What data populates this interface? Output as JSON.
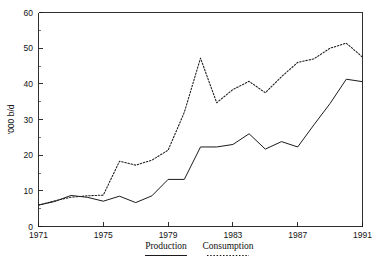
{
  "chart_data": {
    "type": "line",
    "title": "",
    "xlabel": "",
    "ylabel": "'000 b/d",
    "xlim": [
      1971,
      1991
    ],
    "ylim": [
      0,
      60
    ],
    "grid": false,
    "legend_position": "bottom",
    "x": [
      1971,
      1972,
      1973,
      1974,
      1975,
      1976,
      1977,
      1978,
      1979,
      1980,
      1981,
      1982,
      1983,
      1984,
      1985,
      1986,
      1987,
      1988,
      1989,
      1990,
      1991
    ],
    "xticks": [
      1971,
      1975,
      1979,
      1983,
      1987,
      1991
    ],
    "xtick_labels": [
      "1971",
      "1975",
      "1979",
      "1983",
      "1987",
      "1991"
    ],
    "yticks": [
      0,
      10,
      20,
      30,
      40,
      50,
      60
    ],
    "ytick_labels": [
      "0",
      "10",
      "20",
      "30",
      "40",
      "50",
      "60"
    ],
    "yticks_minor": [
      5,
      15,
      25,
      35,
      45,
      55
    ],
    "series": [
      {
        "name": "Production",
        "style": "solid",
        "color": "#1b1b1b",
        "values": [
          6.0,
          7.0,
          8.7,
          8.2,
          7.1,
          8.5,
          6.7,
          8.6,
          13.2,
          13.2,
          22.3,
          22.3,
          23.0,
          26.0,
          21.7,
          23.8,
          22.3,
          28.5,
          34.5,
          41.3,
          40.6
        ]
      },
      {
        "name": "Consumption",
        "style": "dotted",
        "color": "#1b1b1b",
        "values": [
          6.0,
          7.2,
          8.2,
          8.6,
          8.8,
          18.3,
          17.2,
          18.6,
          21.4,
          32.0,
          47.2,
          34.7,
          38.4,
          40.7,
          37.5,
          42.0,
          46.0,
          47.0,
          50.0,
          51.4,
          47.5
        ]
      }
    ]
  },
  "legend": {
    "items": [
      {
        "label": "Production",
        "style": "solid"
      },
      {
        "label": "Consumption",
        "style": "dotted"
      }
    ]
  }
}
